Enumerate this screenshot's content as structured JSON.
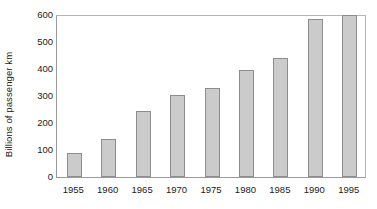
{
  "chart_data": {
    "type": "bar",
    "title": "",
    "subtitle": "",
    "xlabel": "",
    "ylabel": "Billions of passenger km",
    "categories": [
      "1955",
      "1960",
      "1965",
      "1970",
      "1975",
      "1980",
      "1985",
      "1990",
      "1995"
    ],
    "values": [
      88,
      141,
      244,
      304,
      330,
      396,
      440,
      585,
      600
    ],
    "series": [
      {
        "name": "Passenger km",
        "values": [
          88,
          141,
          244,
          304,
          330,
          396,
          440,
          585,
          600
        ]
      }
    ],
    "ylim": [
      0,
      600
    ],
    "yticks": [
      0,
      100,
      200,
      300,
      400,
      500,
      600
    ],
    "ytick_labels": [
      "0",
      "100",
      "200",
      "300",
      "400",
      "500",
      "600"
    ],
    "xtick_labels": [
      "1955",
      "1960",
      "1965",
      "1970",
      "1975",
      "1980",
      "1985",
      "1990",
      "1995"
    ],
    "grid": false,
    "legend": false,
    "legend_position": "none",
    "colors": {
      "bar_fill": "#cbcbcb",
      "bar_edge": "#8d8d8d",
      "axis": "#9a9a9a",
      "text": "#1a1a1a",
      "background": "#ffffff"
    }
  }
}
